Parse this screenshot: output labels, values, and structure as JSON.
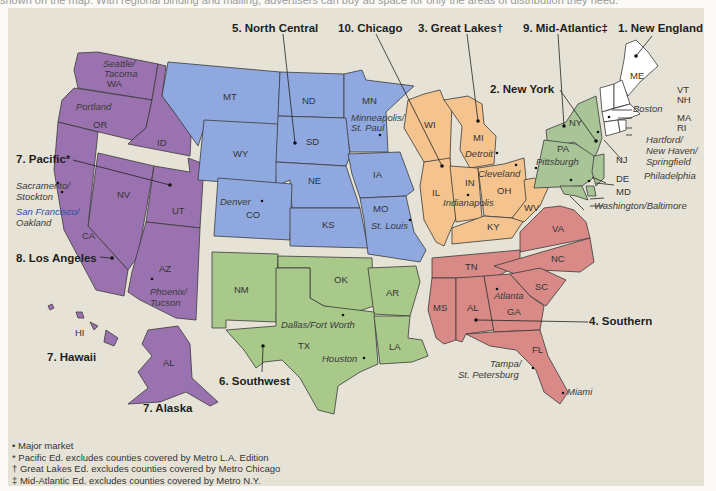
{
  "intro_text": "shown on the map. With regional binding and mailing, advertisers can buy ad space for only the areas of distribution they need.",
  "colors": {
    "background": "#e6e3d6",
    "pacific": "#9b72b0",
    "north_central": "#8fa9e0",
    "great_lakes": "#f4c38e",
    "mid_atlantic": "#a9c597",
    "new_england": "#ffffff",
    "southern": "#d98a86",
    "southwest": "#a8c98a"
  },
  "regions": [
    {
      "number": "1",
      "name": "New England",
      "label": "1. New England"
    },
    {
      "number": "2",
      "name": "New York",
      "label": "2. New York"
    },
    {
      "number": "3",
      "name": "Great Lakes",
      "label": "3. Great Lakes†"
    },
    {
      "number": "4",
      "name": "Southern",
      "label": "4. Southern"
    },
    {
      "number": "5",
      "name": "North Central",
      "label": "5. North Central"
    },
    {
      "number": "6",
      "name": "Southwest",
      "label": "6. Southwest"
    },
    {
      "number": "7",
      "name": "Pacific",
      "label": "7. Pacific*"
    },
    {
      "number": "7",
      "name": "Hawaii",
      "label": "7. Hawaii"
    },
    {
      "number": "7",
      "name": "Alaska",
      "label": "7. Alaska"
    },
    {
      "number": "8",
      "name": "Los Angeles",
      "label": "8. Los Angeles"
    },
    {
      "number": "9",
      "name": "Mid-Atlantic",
      "label": "9. Mid-Atlantic‡"
    },
    {
      "number": "10",
      "name": "Chicago",
      "label": "10. Chicago"
    }
  ],
  "states": {
    "WA": "WA",
    "OR": "OR",
    "ID": "ID",
    "NV": "NV",
    "UT": "UT",
    "CA": "CA",
    "AZ": "AZ",
    "HI": "HI",
    "AL_ak": "AL",
    "MT": "MT",
    "ND": "ND",
    "MN": "MN",
    "WY": "WY",
    "SD": "SD",
    "NE": "NE",
    "IA": "IA",
    "CO": "CO",
    "KS": "KS",
    "MO": "MO",
    "WI": "WI",
    "MI": "MI",
    "IL": "IL",
    "IN": "IN",
    "OH": "OH",
    "KY": "KY",
    "WV": "WV",
    "NY": "NY",
    "PA": "PA",
    "NJ": "NJ",
    "DE": "DE",
    "MD": "MD",
    "ME": "ME",
    "VT": "VT",
    "NH": "NH",
    "MA": "MA",
    "RI": "RI",
    "NM": "NM",
    "OK": "OK",
    "AR": "AR",
    "TX": "TX",
    "LA": "LA",
    "VA": "VA",
    "NC": "NC",
    "TN": "TN",
    "SC": "SC",
    "MS": "MS",
    "AL": "AL",
    "GA": "GA",
    "FL": "FL"
  },
  "cities": {
    "seattle": [
      "Seattle/",
      "Tacoma"
    ],
    "portland": "Portland",
    "sacramento": [
      "Sacramento/",
      "Stockton"
    ],
    "sanfrancisco": [
      "San Francisco/",
      "Oakland"
    ],
    "phoenix": [
      "Phoenix/",
      "Tucson"
    ],
    "denver": "Denver",
    "minneapolis": [
      "Minneapolis/",
      "St. Paul"
    ],
    "stlouis": "St. Louis",
    "detroit": "Detroit",
    "cleveland": "Cleveland",
    "indianapolis": "Indianapolis",
    "pittsburgh": "Pittsburgh",
    "boston": "Boston",
    "hartford": [
      "Hartford/",
      "New Haven/",
      "Springfield"
    ],
    "philadelphia": "Philadelphia",
    "washington": "Washington/Baltimore",
    "dallas": "Dallas/Fort Worth",
    "houston": "Houston",
    "atlanta": "Atlanta",
    "tampa": [
      "Tampa/",
      "St. Petersburg"
    ],
    "miami": "Miami"
  },
  "legend": [
    {
      "symbol": "•",
      "text": "Major market"
    },
    {
      "symbol": "*",
      "text": "Pacific Ed. excludes counties covered by Metro L.A. Edition"
    },
    {
      "symbol": "†",
      "text": "Great Lakes Ed. excludes counties covered by Metro Chicago"
    },
    {
      "symbol": "‡",
      "text": "Mid-Atlantic Ed. excludes counties covered by Metro N.Y."
    }
  ]
}
